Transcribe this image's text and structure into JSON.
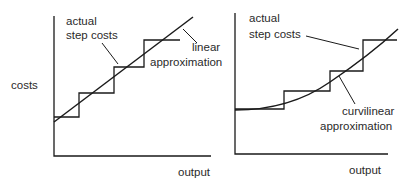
{
  "diagram": {
    "left_panel": {
      "y_axis_label": "costs",
      "x_axis_label": "output",
      "step_label_line1": "actual",
      "step_label_line2": "step costs",
      "approx_label_line1": "linear",
      "approx_label_line2": "approximation"
    },
    "right_panel": {
      "x_axis_label": "output",
      "step_label_line1": "actual",
      "step_label_line2": "step costs",
      "approx_label_line1": "curvilinear",
      "approx_label_line2": "approximation"
    },
    "colors": {
      "ink": "#1a1a1a",
      "background": "#ffffff"
    }
  }
}
